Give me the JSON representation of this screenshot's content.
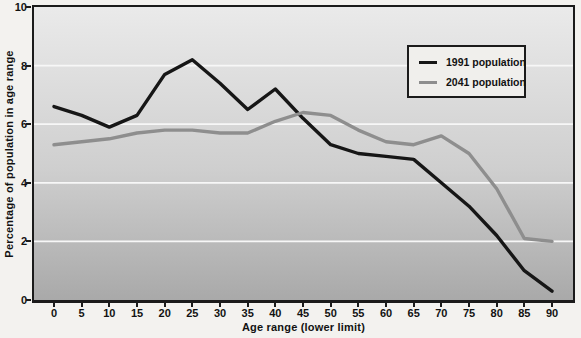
{
  "colors": {
    "page_bg": "#f3f2ef",
    "plot_top": "#eaeaea",
    "plot_bottom": "#a9a9a9",
    "gridline": "#f7f7f7",
    "frame": "#1b1b1b",
    "text": "#121212",
    "legend_bg": "#f0efec",
    "series_1991": "#161616",
    "series_2041": "#8e8e8e"
  },
  "chart_data": {
    "type": "line",
    "title": "",
    "xlabel": "Age range (lower limit)",
    "ylabel": "Percentage of population in age range",
    "x": [
      0,
      5,
      10,
      15,
      20,
      25,
      30,
      35,
      40,
      45,
      50,
      55,
      60,
      65,
      70,
      75,
      80,
      85,
      90
    ],
    "ylim": [
      0,
      10
    ],
    "yticks": [
      0,
      2,
      4,
      6,
      8,
      10
    ],
    "grid": "horizontal-white",
    "legend_position": "top-right-inside-plot",
    "series": [
      {
        "name": "1991 population",
        "color": "#161616",
        "values": [
          6.6,
          6.3,
          5.9,
          6.3,
          7.7,
          8.2,
          7.4,
          6.5,
          7.2,
          6.2,
          5.3,
          5.0,
          4.9,
          4.8,
          4.0,
          3.2,
          2.2,
          1.0,
          0.3
        ]
      },
      {
        "name": "2041 population",
        "color": "#8e8e8e",
        "values": [
          5.3,
          5.4,
          5.5,
          5.7,
          5.8,
          5.8,
          5.7,
          5.7,
          6.1,
          6.4,
          6.3,
          5.8,
          5.4,
          5.3,
          5.6,
          5.0,
          3.8,
          2.1,
          2.0
        ]
      }
    ]
  }
}
